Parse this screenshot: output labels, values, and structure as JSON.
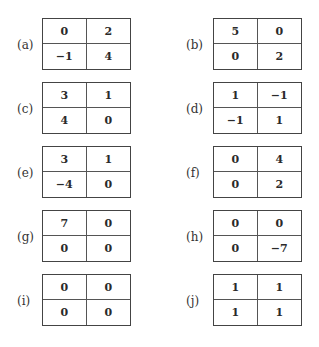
{
  "matrices": [
    {
      "label": "(a)",
      "cells": [
        "0",
        "2",
        "−1",
        "4"
      ]
    },
    {
      "label": "(b)",
      "cells": [
        "5",
        "0",
        "0",
        "2"
      ]
    },
    {
      "label": "(c)",
      "cells": [
        "3",
        "1",
        "4",
        "0"
      ]
    },
    {
      "label": "(d)",
      "cells": [
        "1",
        "−1",
        "−1",
        "1"
      ]
    },
    {
      "label": "(e)",
      "cells": [
        "3",
        "1",
        "−4",
        "0"
      ]
    },
    {
      "label": "(f)",
      "cells": [
        "0",
        "4",
        "0",
        "2"
      ]
    },
    {
      "label": "(g)",
      "cells": [
        "7",
        "0",
        "0",
        "0"
      ]
    },
    {
      "label": "(h)",
      "cells": [
        "0",
        "0",
        "0",
        "−7"
      ]
    },
    {
      "label": "(i)",
      "cells": [
        "0",
        "0",
        "0",
        "0"
      ]
    },
    {
      "label": "(j)",
      "cells": [
        "1",
        "1",
        "1",
        "1"
      ]
    }
  ]
}
